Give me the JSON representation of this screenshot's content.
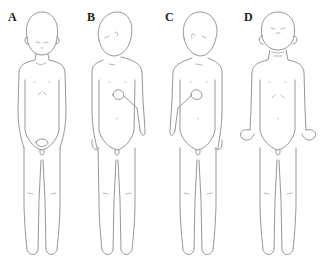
{
  "figure": {
    "panels": [
      {
        "label": "A",
        "pose": "hands clasped in front, head slightly bowed, eyes closed"
      },
      {
        "label": "B",
        "pose": "head tilted to right shoulder, right hand at chest, left arm hanging"
      },
      {
        "label": "C",
        "pose": "head tilted to left shoulder, right hand at chest, left arm hanging"
      },
      {
        "label": "D",
        "pose": "head tilted back, arms at sides with hands flexed outward"
      }
    ],
    "colors": {
      "line": "#8a8a8a",
      "label": "#222222",
      "background": "#ffffff"
    }
  }
}
